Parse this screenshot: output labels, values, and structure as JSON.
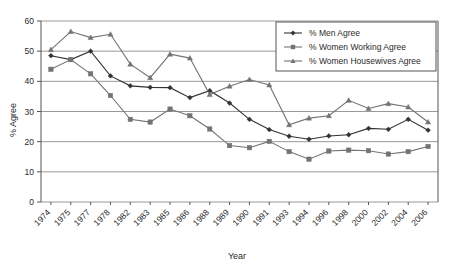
{
  "chart_data": {
    "type": "line",
    "title": "",
    "xlabel": "Year",
    "ylabel": "% Agree",
    "ylim": [
      0,
      60
    ],
    "ytick_step": 10,
    "yticks": [
      "0",
      "10",
      "20",
      "30",
      "40",
      "50",
      "60"
    ],
    "grid": "horizontal",
    "legend_position": "top-right",
    "categories": [
      "1974",
      "1975",
      "1977",
      "1978",
      "1982",
      "1983",
      "1985",
      "1986",
      "1988",
      "1989",
      "1990",
      "1991",
      "1993",
      "1994",
      "1996",
      "1998",
      "2000",
      "2002",
      "2004",
      "2006"
    ],
    "series": [
      {
        "name": "% Men Agree",
        "marker": "diamond",
        "color": "#333333",
        "values": [
          48.5,
          47.2,
          50.0,
          41.8,
          38.5,
          38.0,
          37.9,
          34.6,
          36.9,
          32.8,
          27.4,
          24.0,
          21.8,
          20.8,
          21.9,
          22.3,
          24.4,
          24.1,
          27.4,
          23.8
        ]
      },
      {
        "name": "% Women Working Agree",
        "marker": "square",
        "color": "#737373",
        "values": [
          44.0,
          47.2,
          42.5,
          35.3,
          27.4,
          26.5,
          30.8,
          28.6,
          24.2,
          18.7,
          18.0,
          20.1,
          16.7,
          14.2,
          16.9,
          17.2,
          17.0,
          15.9,
          16.7,
          18.4
        ]
      },
      {
        "name": "% Women Housewives Agree",
        "marker": "triangle",
        "color": "#737373",
        "values": [
          50.5,
          56.5,
          54.5,
          55.6,
          45.7,
          41.2,
          49.0,
          47.7,
          35.6,
          38.4,
          40.6,
          38.8,
          25.6,
          27.8,
          28.6,
          33.7,
          31.0,
          32.6,
          31.5,
          26.5
        ]
      }
    ]
  },
  "legend": {
    "items": [
      {
        "label": "% Men Agree"
      },
      {
        "label": "% Women Working Agree"
      },
      {
        "label": "% Women Housewives Agree"
      }
    ]
  },
  "axes": {
    "y_title": "% Agree",
    "x_title": "Year"
  },
  "colors": {
    "men": "#333333",
    "women_working": "#737373",
    "women_housewives": "#737373",
    "gridline": "#999999",
    "axis": "#555555",
    "background": "#ffffff"
  }
}
